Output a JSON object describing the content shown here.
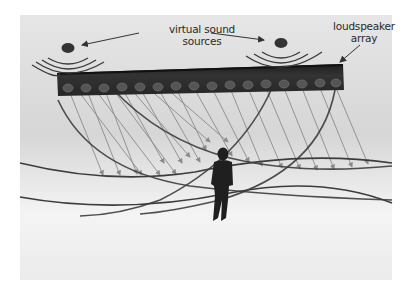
{
  "figure": {
    "labels": {
      "virtual_sources_line1": "virtual sound",
      "virtual_sources_line2": "sources",
      "array_line1": "loudspeaker",
      "array_line2": "array"
    },
    "elements": {
      "virtual_sources_count": 2,
      "loudspeaker_count": 16,
      "listener": "standing human figure"
    },
    "colors": {
      "background_top": "#d9d9d9",
      "background_bottom": "#ffffff",
      "array_bar": "#2b2b2b",
      "source_dot": "#333333",
      "wavefront": "#3c3c3c",
      "ray": "#8a8a8a",
      "label_text": "#2a2a2a"
    }
  }
}
